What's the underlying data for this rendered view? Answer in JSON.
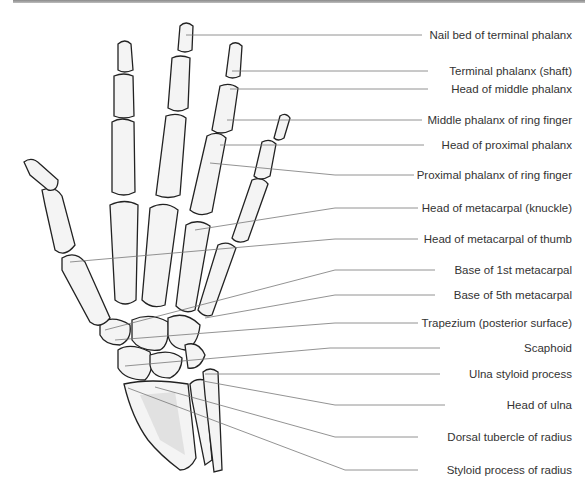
{
  "diagram": {
    "title": "",
    "colors": {
      "label_text": "#333333",
      "leader_line": "#777777",
      "bone_outline": "#222222",
      "bone_fill": "#f4f4f4",
      "top_bar": "#9a9a9a"
    },
    "labels": [
      {
        "id": "nail-bed",
        "text": "Nail bed of terminal phalanx",
        "y": 35
      },
      {
        "id": "terminal-phalanx-shaft",
        "text": "Terminal phalanx (shaft)",
        "y": 71
      },
      {
        "id": "head-middle-phalanx",
        "text": "Head of middle phalanx",
        "y": 89
      },
      {
        "id": "middle-phalanx-ring",
        "text": "Middle phalanx of ring finger",
        "y": 120
      },
      {
        "id": "head-proximal-phalanx",
        "text": "Head of proximal phalanx",
        "y": 145
      },
      {
        "id": "proximal-phalanx-ring",
        "text": "Proximal phalanx of ring finger",
        "y": 175
      },
      {
        "id": "head-metacarpal-knuckle",
        "text": "Head of metacarpal (knuckle)",
        "y": 208
      },
      {
        "id": "head-metacarpal-thumb",
        "text": "Head of metacarpal of thumb",
        "y": 239
      },
      {
        "id": "base-1st-metacarpal",
        "text": "Base of 1st metacarpal",
        "y": 270
      },
      {
        "id": "base-5th-metacarpal",
        "text": "Base of 5th metacarpal",
        "y": 295
      },
      {
        "id": "trapezium",
        "text": "Trapezium (posterior surface)",
        "y": 323
      },
      {
        "id": "scaphoid",
        "text": "Scaphoid",
        "y": 348
      },
      {
        "id": "ulna-styloid",
        "text": "Ulna styloid process",
        "y": 374
      },
      {
        "id": "head-ulna",
        "text": "Head of ulna",
        "y": 405
      },
      {
        "id": "dorsal-tubercle-radius",
        "text": "Dorsal tubercle of radius",
        "y": 437
      },
      {
        "id": "styloid-process-radius",
        "text": "Styloid process of radius",
        "y": 470
      }
    ]
  }
}
